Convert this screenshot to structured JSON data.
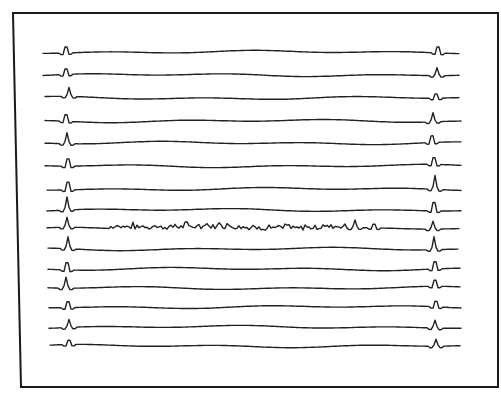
{
  "figure": {
    "background": "#ffffff",
    "ink_color": "#222222",
    "frame": {
      "x1_top": 13,
      "x1_bottom": 21,
      "y1": 13,
      "x2": 498,
      "y2": 387
    }
  },
  "chart_data": {
    "type": "line",
    "title": "",
    "xlabel": "",
    "ylabel": "",
    "grid": false,
    "legend": "none",
    "x_range": [
      43,
      460
    ],
    "trace_count": 15,
    "series": [
      {
        "name": "trace-1",
        "baseline_y": 52,
        "start_x": 43,
        "end_x": 460,
        "spikes": [
          {
            "x": 66,
            "h": 10
          },
          {
            "x": 438,
            "h": 10
          }
        ],
        "noisy": false
      },
      {
        "name": "trace-2",
        "baseline_y": 75,
        "start_x": 43,
        "end_x": 460,
        "spikes": [
          {
            "x": 66,
            "h": 9
          },
          {
            "x": 437,
            "h": 8
          }
        ],
        "noisy": false
      },
      {
        "name": "trace-3",
        "baseline_y": 98,
        "start_x": 45,
        "end_x": 460,
        "spikes": [
          {
            "x": 69,
            "h": 9
          },
          {
            "x": 436,
            "h": 7
          }
        ],
        "noisy": false
      },
      {
        "name": "trace-4",
        "baseline_y": 121,
        "start_x": 45,
        "end_x": 461,
        "spikes": [
          {
            "x": 66,
            "h": 11
          },
          {
            "x": 433,
            "h": 9
          }
        ],
        "noisy": false
      },
      {
        "name": "trace-5",
        "baseline_y": 143,
        "start_x": 45,
        "end_x": 461,
        "spikes": [
          {
            "x": 67,
            "h": 11
          },
          {
            "x": 432,
            "h": 11
          }
        ],
        "noisy": false
      },
      {
        "name": "trace-6",
        "baseline_y": 166,
        "start_x": 45,
        "end_x": 461,
        "spikes": [
          {
            "x": 68,
            "h": 12
          },
          {
            "x": 434,
            "h": 11
          }
        ],
        "noisy": false
      },
      {
        "name": "trace-7",
        "baseline_y": 189,
        "start_x": 47,
        "end_x": 461,
        "spikes": [
          {
            "x": 68,
            "h": 13
          },
          {
            "x": 435,
            "h": 14
          }
        ],
        "noisy": false
      },
      {
        "name": "trace-8",
        "baseline_y": 210,
        "start_x": 47,
        "end_x": 461,
        "spikes": [
          {
            "x": 67,
            "h": 13
          },
          {
            "x": 434,
            "h": 14
          }
        ],
        "noisy": false
      },
      {
        "name": "trace-9",
        "baseline_y": 229,
        "start_x": 47,
        "end_x": 459,
        "spikes": [
          {
            "x": 67,
            "h": 10
          },
          {
            "x": 355,
            "h": 8
          },
          {
            "x": 374,
            "h": 6
          },
          {
            "x": 433,
            "h": 8
          }
        ],
        "noisy": true,
        "noise_range": [
          110,
          345
        ]
      },
      {
        "name": "trace-10",
        "baseline_y": 249,
        "start_x": 48,
        "end_x": 459,
        "spikes": [
          {
            "x": 68,
            "h": 12
          },
          {
            "x": 434,
            "h": 13
          }
        ],
        "noisy": false
      },
      {
        "name": "trace-11",
        "baseline_y": 269,
        "start_x": 48,
        "end_x": 461,
        "spikes": [
          {
            "x": 67,
            "h": 12
          },
          {
            "x": 435,
            "h": 12
          }
        ],
        "noisy": false
      },
      {
        "name": "trace-12",
        "baseline_y": 288,
        "start_x": 48,
        "end_x": 461,
        "spikes": [
          {
            "x": 66,
            "h": 11
          },
          {
            "x": 435,
            "h": 10
          }
        ],
        "noisy": false
      },
      {
        "name": "trace-13",
        "baseline_y": 307,
        "start_x": 49,
        "end_x": 461,
        "spikes": [
          {
            "x": 68,
            "h": 10
          },
          {
            "x": 436,
            "h": 9
          }
        ],
        "noisy": false
      },
      {
        "name": "trace-14",
        "baseline_y": 327,
        "start_x": 49,
        "end_x": 461,
        "spikes": [
          {
            "x": 69,
            "h": 8
          },
          {
            "x": 435,
            "h": 8
          }
        ],
        "noisy": false
      },
      {
        "name": "trace-15",
        "baseline_y": 346,
        "start_x": 50,
        "end_x": 461,
        "spikes": [
          {
            "x": 69,
            "h": 7
          },
          {
            "x": 436,
            "h": 7
          }
        ],
        "noisy": false
      }
    ]
  }
}
